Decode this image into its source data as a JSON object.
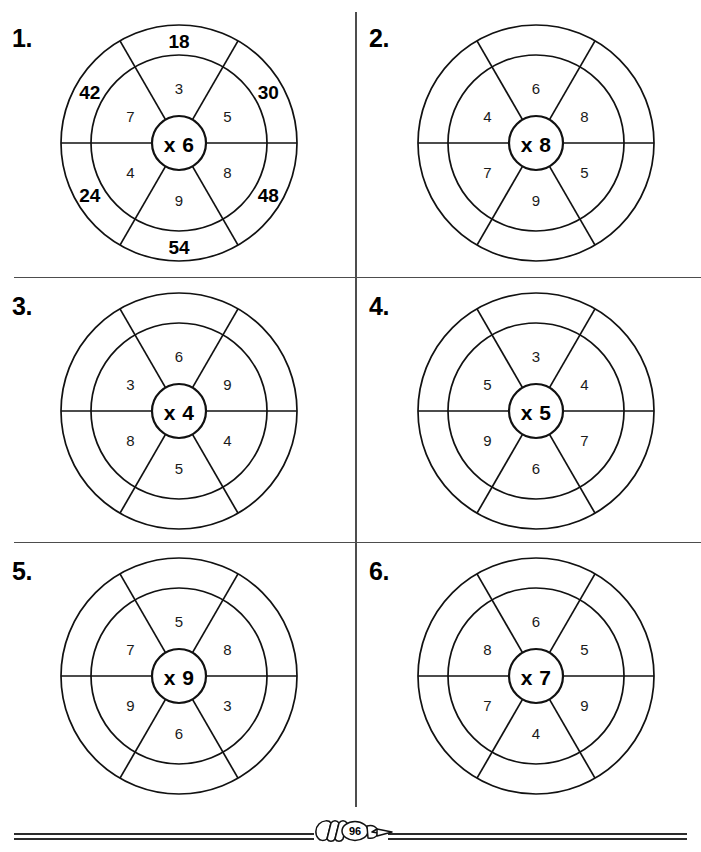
{
  "page": {
    "footer": {
      "page_number": "96",
      "icon": "pencil-icon"
    }
  },
  "chart_data": {
    "type": "diagram",
    "layout": {
      "columns": 2,
      "rows": 3
    },
    "sector_angles_deg": [
      0,
      60,
      120,
      180,
      240,
      300
    ],
    "wheels": [
      {
        "number_label": "1.",
        "hub_label": "x 6",
        "multiplier": 6,
        "inner_values": [
          "3",
          "5",
          "8",
          "9",
          "4",
          "7"
        ],
        "outer_values": [
          "18",
          "30",
          "48",
          "54",
          "24",
          "42"
        ],
        "outer_filled": true
      },
      {
        "number_label": "2.",
        "hub_label": "x 8",
        "multiplier": 8,
        "inner_values": [
          "6",
          "8",
          "5",
          "9",
          "7",
          "4"
        ],
        "outer_values": [
          "",
          "",
          "",
          "",
          "",
          ""
        ],
        "outer_filled": false
      },
      {
        "number_label": "3.",
        "hub_label": "x 4",
        "multiplier": 4,
        "inner_values": [
          "6",
          "9",
          "4",
          "5",
          "8",
          "3"
        ],
        "outer_values": [
          "",
          "",
          "",
          "",
          "",
          ""
        ],
        "outer_filled": false
      },
      {
        "number_label": "4.",
        "hub_label": "x 5",
        "multiplier": 5,
        "inner_values": [
          "3",
          "4",
          "7",
          "6",
          "9",
          "5"
        ],
        "outer_values": [
          "",
          "",
          "",
          "",
          "",
          ""
        ],
        "outer_filled": false
      },
      {
        "number_label": "5.",
        "hub_label": "x 9",
        "multiplier": 9,
        "inner_values": [
          "5",
          "8",
          "3",
          "6",
          "9",
          "7"
        ],
        "outer_values": [
          "",
          "",
          "",
          "",
          "",
          ""
        ],
        "outer_filled": false
      },
      {
        "number_label": "6.",
        "hub_label": "x 7",
        "multiplier": 7,
        "inner_values": [
          "6",
          "5",
          "9",
          "4",
          "7",
          "8"
        ],
        "outer_values": [
          "",
          "",
          "",
          "",
          "",
          ""
        ],
        "outer_filled": false
      }
    ]
  }
}
